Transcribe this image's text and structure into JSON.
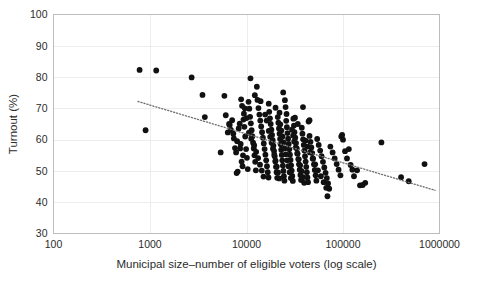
{
  "chart_data": {
    "type": "scatter",
    "title": "",
    "xlabel": "Municipal size–number of eligible voters (log scale)",
    "ylabel": "Turnout (%)",
    "x_scale": "log",
    "xlim": [
      100,
      1000000
    ],
    "ylim": [
      30,
      100
    ],
    "x_ticks": [
      100,
      1000,
      10000,
      100000,
      1000000
    ],
    "x_tick_labels": [
      "100",
      "1000",
      "10000",
      "100000",
      "1000000"
    ],
    "y_ticks": [
      30,
      40,
      50,
      60,
      70,
      80,
      90,
      100
    ],
    "y_tick_labels": [
      "30",
      "40",
      "50",
      "60",
      "70",
      "80",
      "90",
      "100"
    ],
    "grid": "horizontal-and-vertical",
    "grid_color": "#ededed",
    "point_color": "#111111",
    "point_radius": 2.9,
    "legend": "none",
    "trendline": {
      "style": "dotted",
      "color": "#6e6e6e",
      "x_start": 750,
      "y_start": 72.2,
      "x_end": 900000,
      "y_end": 43.8
    },
    "points": [
      [
        780,
        82.3
      ],
      [
        1160,
        82.1
      ],
      [
        900,
        63.0
      ],
      [
        2700,
        79.9
      ],
      [
        3500,
        74.3
      ],
      [
        3700,
        67.2
      ],
      [
        5400,
        55.9
      ],
      [
        5900,
        74.0
      ],
      [
        6400,
        62.3
      ],
      [
        6700,
        64.7
      ],
      [
        6900,
        63.1
      ],
      [
        7100,
        66.2
      ],
      [
        7400,
        60.4
      ],
      [
        7600,
        57.3
      ],
      [
        7800,
        55.9
      ],
      [
        7900,
        49.3
      ],
      [
        8100,
        49.8
      ],
      [
        8300,
        63.6
      ],
      [
        8500,
        65.1
      ],
      [
        8700,
        58.6
      ],
      [
        8900,
        53.0
      ],
      [
        9100,
        51.5
      ],
      [
        9300,
        66.4
      ],
      [
        9500,
        64.1
      ],
      [
        9700,
        61.0
      ],
      [
        9900,
        57.0
      ],
      [
        10100,
        54.2
      ],
      [
        10300,
        50.6
      ],
      [
        10500,
        72.1
      ],
      [
        10700,
        69.9
      ],
      [
        10900,
        67.3
      ],
      [
        11100,
        65.2
      ],
      [
        11300,
        63.0
      ],
      [
        11500,
        61.1
      ],
      [
        11700,
        59.0
      ],
      [
        11900,
        57.2
      ],
      [
        12100,
        55.0
      ],
      [
        12300,
        52.9
      ],
      [
        12500,
        50.2
      ],
      [
        11000,
        79.6
      ],
      [
        12800,
        76.9
      ],
      [
        13000,
        72.7
      ],
      [
        13300,
        70.1
      ],
      [
        13600,
        68.0
      ],
      [
        13900,
        66.1
      ],
      [
        14200,
        64.2
      ],
      [
        14500,
        62.4
      ],
      [
        14800,
        60.6
      ],
      [
        15100,
        58.8
      ],
      [
        15400,
        57.0
      ],
      [
        15700,
        55.2
      ],
      [
        16000,
        53.4
      ],
      [
        16300,
        51.5
      ],
      [
        16600,
        49.6
      ],
      [
        16900,
        47.9
      ],
      [
        17200,
        68.9
      ],
      [
        17500,
        66.8
      ],
      [
        17800,
        65.0
      ],
      [
        18100,
        63.2
      ],
      [
        18400,
        61.5
      ],
      [
        18700,
        59.8
      ],
      [
        19000,
        58.1
      ],
      [
        19300,
        56.4
      ],
      [
        19600,
        54.7
      ],
      [
        19900,
        53.0
      ],
      [
        20200,
        51.3
      ],
      [
        20500,
        49.6
      ],
      [
        20800,
        47.8
      ],
      [
        21100,
        67.2
      ],
      [
        21400,
        65.4
      ],
      [
        21700,
        63.6
      ],
      [
        22000,
        61.9
      ],
      [
        22300,
        60.2
      ],
      [
        22600,
        58.5
      ],
      [
        22900,
        56.8
      ],
      [
        23200,
        55.1
      ],
      [
        23500,
        53.4
      ],
      [
        23800,
        51.7
      ],
      [
        24100,
        50.0
      ],
      [
        24400,
        48.3
      ],
      [
        24700,
        46.9
      ],
      [
        25000,
        72.6
      ],
      [
        25400,
        70.4
      ],
      [
        25800,
        66.0
      ],
      [
        26200,
        64.0
      ],
      [
        26600,
        62.1
      ],
      [
        27000,
        60.3
      ],
      [
        27400,
        58.6
      ],
      [
        27800,
        56.9
      ],
      [
        28200,
        55.2
      ],
      [
        28600,
        53.5
      ],
      [
        29000,
        51.8
      ],
      [
        29400,
        50.1
      ],
      [
        29800,
        48.4
      ],
      [
        30200,
        46.8
      ],
      [
        24000,
        75.1
      ],
      [
        30600,
        66.7
      ],
      [
        31000,
        64.5
      ],
      [
        31400,
        62.4
      ],
      [
        32000,
        60.6
      ],
      [
        32600,
        58.9
      ],
      [
        33200,
        57.2
      ],
      [
        33800,
        55.5
      ],
      [
        34400,
        53.8
      ],
      [
        35000,
        52.1
      ],
      [
        35600,
        50.4
      ],
      [
        36200,
        48.7
      ],
      [
        36800,
        47.1
      ],
      [
        37400,
        63.8
      ],
      [
        38000,
        61.9
      ],
      [
        38600,
        60.1
      ],
      [
        39200,
        58.3
      ],
      [
        39800,
        56.5
      ],
      [
        40400,
        54.7
      ],
      [
        41000,
        53.0
      ],
      [
        41600,
        51.3
      ],
      [
        42200,
        49.6
      ],
      [
        42800,
        47.9
      ],
      [
        43400,
        46.4
      ],
      [
        38500,
        70.4
      ],
      [
        44000,
        65.8
      ],
      [
        45000,
        61.2
      ],
      [
        46000,
        59.3
      ],
      [
        47000,
        57.5
      ],
      [
        48000,
        55.7
      ],
      [
        49000,
        53.9
      ],
      [
        50000,
        52.1
      ],
      [
        51000,
        50.3
      ],
      [
        52000,
        48.6
      ],
      [
        53000,
        46.9
      ],
      [
        54000,
        60.2
      ],
      [
        56000,
        58.3
      ],
      [
        58000,
        56.5
      ],
      [
        60000,
        54.7
      ],
      [
        62000,
        52.9
      ],
      [
        64000,
        51.1
      ],
      [
        66000,
        49.4
      ],
      [
        68000,
        47.7
      ],
      [
        70000,
        46.0
      ],
      [
        72000,
        44.3
      ],
      [
        69000,
        41.9
      ],
      [
        74000,
        57.8
      ],
      [
        78000,
        55.9
      ],
      [
        82000,
        54.0
      ],
      [
        86000,
        52.2
      ],
      [
        90000,
        50.4
      ],
      [
        94000,
        48.6
      ],
      [
        98000,
        61.5
      ],
      [
        96000,
        61.0
      ],
      [
        100000,
        60.0
      ],
      [
        105000,
        56.3
      ],
      [
        110000,
        54.0
      ],
      [
        115000,
        57.0
      ],
      [
        120000,
        51.9
      ],
      [
        125000,
        50.4
      ],
      [
        130000,
        48.3
      ],
      [
        140000,
        50.2
      ],
      [
        150000,
        45.4
      ],
      [
        160000,
        45.5
      ],
      [
        170000,
        46.2
      ],
      [
        250000,
        59.1
      ],
      [
        400000,
        48.0
      ],
      [
        480000,
        46.7
      ],
      [
        700000,
        52.2
      ],
      [
        9000,
        70.8
      ],
      [
        9400,
        68.3
      ],
      [
        10000,
        66.9
      ],
      [
        10600,
        62.2
      ],
      [
        11200,
        60.3
      ],
      [
        12000,
        58.2
      ],
      [
        12600,
        56.1
      ],
      [
        13200,
        54.1
      ],
      [
        13800,
        52.0
      ],
      [
        14400,
        50.1
      ],
      [
        15000,
        48.2
      ],
      [
        15600,
        68.0
      ],
      [
        16200,
        66.1
      ],
      [
        17000,
        62.8
      ],
      [
        17600,
        60.9
      ],
      [
        18200,
        59.0
      ],
      [
        18800,
        57.1
      ],
      [
        19400,
        55.2
      ],
      [
        20000,
        53.3
      ],
      [
        20600,
        51.4
      ],
      [
        21200,
        49.5
      ],
      [
        21800,
        47.6
      ],
      [
        22400,
        64.9
      ],
      [
        23000,
        62.9
      ],
      [
        23600,
        61.0
      ],
      [
        24200,
        59.1
      ],
      [
        24800,
        57.2
      ],
      [
        25600,
        55.3
      ],
      [
        26400,
        53.4
      ],
      [
        27200,
        51.5
      ],
      [
        28000,
        49.6
      ],
      [
        28800,
        47.7
      ],
      [
        29600,
        63.2
      ],
      [
        30400,
        61.3
      ],
      [
        31200,
        59.4
      ],
      [
        32400,
        57.5
      ],
      [
        33600,
        55.6
      ],
      [
        34800,
        53.7
      ],
      [
        36000,
        51.8
      ],
      [
        37200,
        49.9
      ],
      [
        38400,
        48.0
      ],
      [
        39600,
        46.2
      ],
      [
        41000,
        59.7
      ],
      [
        43000,
        57.8
      ],
      [
        45500,
        55.9
      ],
      [
        48500,
        54.0
      ],
      [
        51500,
        52.1
      ],
      [
        55000,
        50.2
      ],
      [
        59000,
        48.3
      ],
      [
        63000,
        46.4
      ],
      [
        67000,
        44.6
      ],
      [
        7300,
        61.9
      ],
      [
        8000,
        59.5
      ],
      [
        8600,
        57.2
      ],
      [
        9200,
        55.0
      ],
      [
        6100,
        67.8
      ],
      [
        6600,
        65.0
      ],
      [
        12200,
        74.2
      ],
      [
        14000,
        72.3
      ],
      [
        26000,
        68.2
      ],
      [
        31800,
        67.0
      ],
      [
        34000,
        65.0
      ],
      [
        45000,
        66.2
      ],
      [
        20000,
        70.2
      ],
      [
        17000,
        71.5
      ],
      [
        22000,
        68.6
      ],
      [
        8800,
        72.9
      ],
      [
        9600,
        70.0
      ]
    ]
  }
}
